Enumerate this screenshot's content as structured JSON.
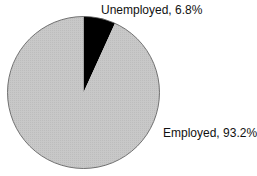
{
  "chart_data": {
    "type": "pie",
    "title": "",
    "start_angle": "12 o'clock",
    "direction": "clockwise",
    "slices": [
      {
        "label": "Unemployed",
        "value": 6.8,
        "display": "Unemployed, 6.8%",
        "color": "#000000"
      },
      {
        "label": "Employed",
        "value": 93.2,
        "display": "Employed, 93.2%",
        "color": "#c6c6c6"
      }
    ],
    "legend": "none",
    "label_placement": "outside"
  }
}
